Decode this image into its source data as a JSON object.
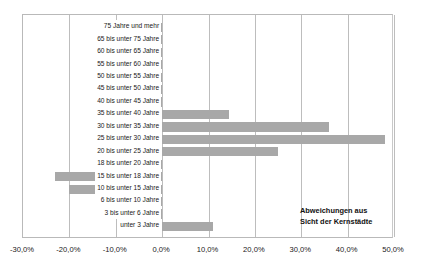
{
  "top_caption": "",
  "annotation": {
    "line1": "Abweichungen aus",
    "line2": "Sicht der Kernstädte"
  },
  "colors": {
    "bar": "#a8a8a8",
    "grid": "#bdbdbd",
    "frame": "#b9b9b9",
    "text": "#1a1a1a",
    "background": "#ffffff"
  },
  "chart_data": {
    "type": "bar",
    "orientation": "horizontal",
    "title": "",
    "subtitle": "",
    "xlabel": "",
    "ylabel": "",
    "xlim": [
      -30.0,
      50.0
    ],
    "xticks": [
      -30.0,
      -20.0,
      -10.0,
      0.0,
      10.0,
      20.0,
      30.0,
      40.0,
      50.0
    ],
    "xtick_labels": [
      "-30,0%",
      "-20,0%",
      "-10,0%",
      "0,0%",
      "10,0%",
      "20,0%",
      "30,0%",
      "40,0%",
      "50,0%"
    ],
    "grid": true,
    "legend": false,
    "annotations": [
      "Abweichungen aus Sicht der Kernstädte"
    ],
    "categories": [
      "75 Jahre und mehr",
      "65 bis unter 75 Jahre",
      "60 bis unter 65 Jahre",
      "55 bis unter 60 Jahre",
      "50 bis unter 55 Jahre",
      "45 bis unter 50 Jahre",
      "40 bis unter 45 Jahre",
      "35 bis unter 40 Jahre",
      "30 bis unter 35 Jahre",
      "25 bis unter 30 Jahre",
      "20 bis unter 25 Jahre",
      "18 bis unter 20 Jahre",
      "15 bis unter 18 Jahre",
      "10 bis unter 15 Jahre",
      "6 bis unter 10 Jahre",
      "3 bis unter 6 Jahre",
      "unter 3 Jahre"
    ],
    "values": [
      -0.3,
      -0.4,
      -0.5,
      -0.6,
      -0.6,
      -0.5,
      -0.4,
      14.5,
      36.0,
      48.0,
      25.0,
      -1.0,
      -23.0,
      -20.0,
      -1.5,
      -0.3,
      11.0
    ]
  }
}
